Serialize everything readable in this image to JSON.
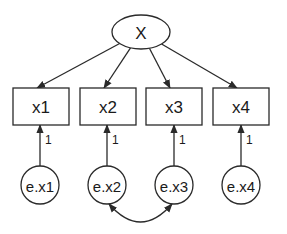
{
  "diagram": {
    "type": "path-diagram",
    "latent": {
      "id": "X",
      "label": "X",
      "cx": 141,
      "cy": 32,
      "rx": 29,
      "ry": 17
    },
    "observed": [
      {
        "id": "x1",
        "label": "x1",
        "x": 13,
        "y": 88,
        "w": 56,
        "h": 37
      },
      {
        "id": "x2",
        "label": "x2",
        "x": 80,
        "y": 88,
        "w": 56,
        "h": 37
      },
      {
        "id": "x3",
        "label": "x3",
        "x": 146,
        "y": 88,
        "w": 56,
        "h": 37
      },
      {
        "id": "x4",
        "label": "x4",
        "x": 213,
        "y": 88,
        "w": 56,
        "h": 37
      }
    ],
    "errors": [
      {
        "id": "e.x1",
        "label": "e.x1",
        "cx": 40,
        "cy": 185,
        "r": 19,
        "weight": "1"
      },
      {
        "id": "e.x2",
        "label": "e.x2",
        "cx": 107,
        "cy": 185,
        "r": 19,
        "weight": "1"
      },
      {
        "id": "e.x3",
        "label": "e.x3",
        "cx": 174,
        "cy": 185,
        "r": 19,
        "weight": "1"
      },
      {
        "id": "e.x4",
        "label": "e.x4",
        "cx": 241,
        "cy": 185,
        "r": 19,
        "weight": "1"
      }
    ],
    "loadings": [
      {
        "from": "X",
        "to": "x1"
      },
      {
        "from": "X",
        "to": "x2"
      },
      {
        "from": "X",
        "to": "x3"
      },
      {
        "from": "X",
        "to": "x4"
      }
    ],
    "covariances": [
      {
        "between": [
          "e.x2",
          "e.x3"
        ]
      }
    ],
    "colors": {
      "stroke": "#2a2a2a",
      "fill": "#ffffff",
      "text": "#1a1a1a"
    }
  }
}
